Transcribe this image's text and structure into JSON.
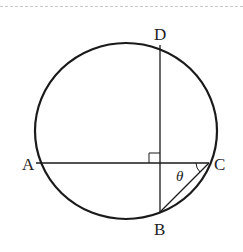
{
  "figure": {
    "type": "geometry",
    "points": {
      "A": {
        "label": "A",
        "x": 35,
        "y": 163
      },
      "B": {
        "label": "B",
        "x": 160,
        "y": 212
      },
      "C": {
        "label": "C",
        "x": 209,
        "y": 163
      },
      "D": {
        "label": "D",
        "x": 160,
        "y": 45
      }
    },
    "angle_label": "θ",
    "right_angle_marker": true,
    "colors": {
      "stroke": "#1a1a1a",
      "border": "#c8c8c8"
    }
  }
}
